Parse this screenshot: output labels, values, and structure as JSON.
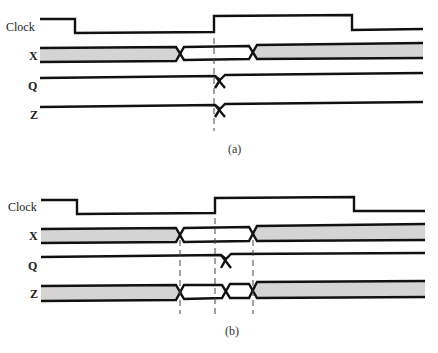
{
  "diagram": {
    "type": "timing-diagram",
    "panels": [
      {
        "caption": "(a)",
        "signals": [
          {
            "name": "Clock",
            "kind": "clock",
            "edges": [
              "fall@75",
              "rise@214",
              "fall@352"
            ]
          },
          {
            "name": "X",
            "kind": "bus",
            "segments": [
              "unknown",
              "valid",
              "unknown"
            ],
            "transitions_x": [
              180,
              253
            ]
          },
          {
            "name": "Q",
            "kind": "single",
            "transitions_x": [
              220
            ]
          },
          {
            "name": "Z",
            "kind": "single",
            "transitions_x": [
              220
            ]
          }
        ],
        "reference_lines_x": [
          214
        ]
      },
      {
        "caption": "(b)",
        "signals": [
          {
            "name": "Clock",
            "kind": "clock",
            "edges": [
              "fall@77",
              "rise@215",
              "fall@354"
            ]
          },
          {
            "name": "X",
            "kind": "bus",
            "segments": [
              "unknown",
              "valid",
              "unknown"
            ],
            "transitions_x": [
              180,
              253
            ]
          },
          {
            "name": "Q",
            "kind": "single",
            "transitions_x": [
              226
            ]
          },
          {
            "name": "Z",
            "kind": "bus",
            "segments": [
              "unknown",
              "valid",
              "valid",
              "unknown"
            ],
            "transitions_x": [
              180,
              226,
              253
            ]
          }
        ],
        "reference_lines_x": [
          180,
          215,
          253
        ]
      }
    ]
  },
  "labels": {
    "a": {
      "clock": "Clock",
      "x": "X",
      "q": "Q",
      "z": "Z",
      "caption": "(a)"
    },
    "b": {
      "clock": "Clock",
      "x": "X",
      "q": "Q",
      "z": "Z",
      "caption": "(b)"
    }
  },
  "colors": {
    "line": "#111111",
    "bus_fill": "#d4d4d4",
    "dash": "#444444"
  }
}
